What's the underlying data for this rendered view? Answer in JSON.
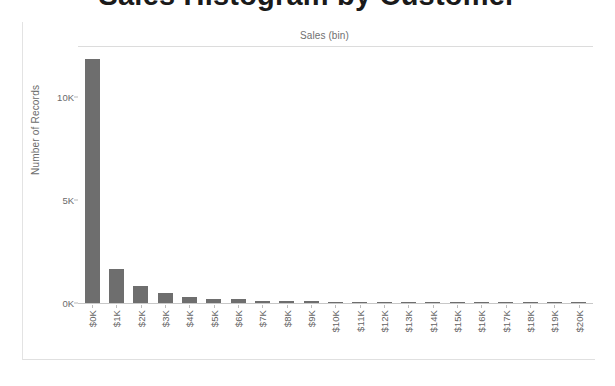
{
  "title": "Sales Histogram by Customer",
  "column_field_label": "Sales (bin)",
  "colors": {
    "bar": "#6e6e6e",
    "axis": "#c8c8c8",
    "tick_text": "#6b6b6b",
    "frame": "#e3e3e3"
  },
  "chart_data": {
    "type": "bar",
    "title": "Sales Histogram by Customer",
    "xlabel": "Sales (bin)",
    "ylabel": "Number of Records",
    "ylim": [
      0,
      12500
    ],
    "grid": false,
    "legend": null,
    "y_ticks": [
      "0K",
      "5K",
      "10K"
    ],
    "y_tick_values": [
      0,
      5000,
      10000
    ],
    "categories": [
      "$0K",
      "$1K",
      "$2K",
      "$3K",
      "$4K",
      "$5K",
      "$6K",
      "$7K",
      "$8K",
      "$9K",
      "$10K",
      "$11K",
      "$12K",
      "$13K",
      "$14K",
      "$15K",
      "$16K",
      "$17K",
      "$18K",
      "$19K",
      "$20K"
    ],
    "values": [
      11900,
      1680,
      830,
      480,
      300,
      205,
      195,
      120,
      90,
      75,
      45,
      40,
      38,
      45,
      30,
      35,
      40,
      12,
      10,
      8,
      10
    ]
  }
}
